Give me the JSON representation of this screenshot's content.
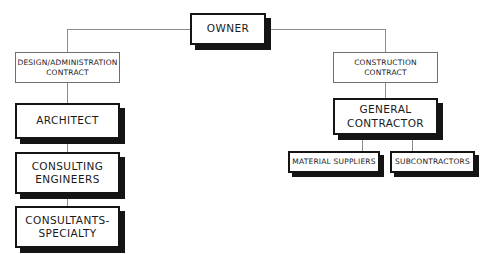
{
  "diagram": {
    "type": "organization-chart",
    "colors": {
      "background": "#ffffff",
      "line": "#8d8d8d",
      "heavy_border": "#141414",
      "thin_border": "#6f6f6f",
      "text": "#1a1a1a",
      "shadow": "#141414"
    },
    "nodes": {
      "owner": {
        "label": "OWNER",
        "style": "heavy"
      },
      "design_admin_contract": {
        "label": "DESIGN/ADMINISTRATION\nCONTRACT",
        "style": "thin"
      },
      "architect": {
        "label": "ARCHITECT",
        "style": "heavy"
      },
      "consulting_engineers": {
        "label": "CONSULTING\nENGINEERS",
        "style": "heavy"
      },
      "consultants_specialty": {
        "label": "CONSULTANTS-\nSPECIALTY",
        "style": "heavy"
      },
      "construction_contract": {
        "label": "CONSTRUCTION\nCONTRACT",
        "style": "thin"
      },
      "general_contractor": {
        "label": "GENERAL\nCONTRACTOR",
        "style": "heavy"
      },
      "material_suppliers": {
        "label": "MATERIAL SUPPLIERS",
        "style": "heavy-small"
      },
      "subcontractors": {
        "label": "SUBCONTRACTORS",
        "style": "heavy-small"
      }
    },
    "edges": [
      {
        "from": "owner",
        "to": "design_admin_contract"
      },
      {
        "from": "design_admin_contract",
        "to": "architect"
      },
      {
        "from": "architect",
        "to": "consulting_engineers"
      },
      {
        "from": "consulting_engineers",
        "to": "consultants_specialty"
      },
      {
        "from": "owner",
        "to": "construction_contract"
      },
      {
        "from": "construction_contract",
        "to": "general_contractor"
      },
      {
        "from": "general_contractor",
        "to": "material_suppliers"
      },
      {
        "from": "general_contractor",
        "to": "subcontractors"
      }
    ]
  }
}
